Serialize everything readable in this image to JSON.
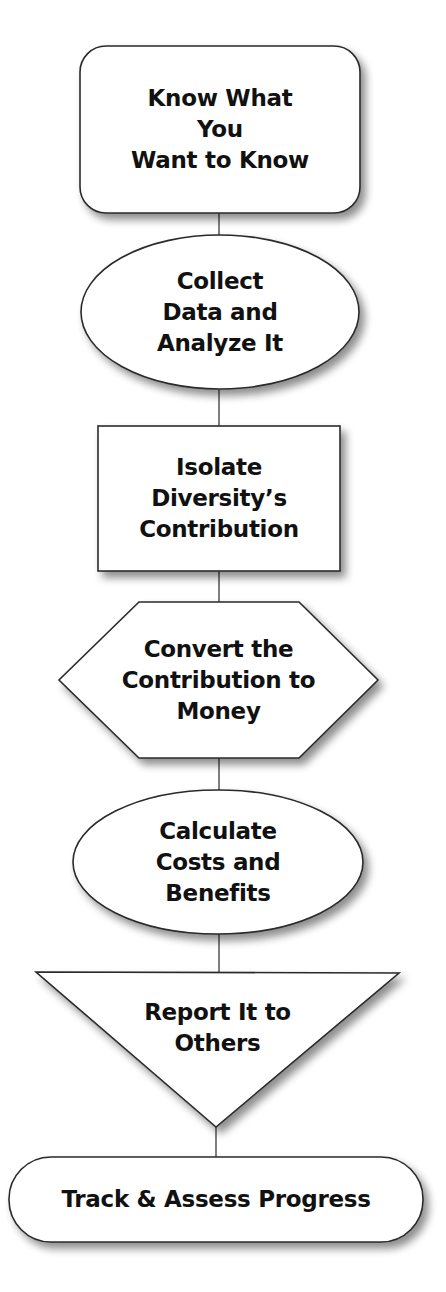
{
  "diagram": {
    "type": "vertical-flowchart",
    "colors": {
      "fill": "#ffffff",
      "stroke": "#2a2a2a",
      "text": "#111111",
      "shadow": "#9a9a9a"
    },
    "steps": [
      {
        "id": "step1",
        "shape": "rounded-rectangle",
        "lines": [
          "Know What",
          "You",
          "Want to Know"
        ]
      },
      {
        "id": "step2",
        "shape": "ellipse",
        "lines": [
          "Collect",
          "Data and",
          "Analyze It"
        ]
      },
      {
        "id": "step3",
        "shape": "rectangle",
        "lines": [
          "Isolate",
          "Diversity’s",
          "Contribution"
        ]
      },
      {
        "id": "step4",
        "shape": "hexagon",
        "lines": [
          "Convert the",
          "Contribution to",
          "Money"
        ]
      },
      {
        "id": "step5",
        "shape": "ellipse",
        "lines": [
          "Calculate",
          "Costs and",
          "Benefits"
        ]
      },
      {
        "id": "step6",
        "shape": "inverted-triangle",
        "lines": [
          "Report It to",
          "Others"
        ]
      },
      {
        "id": "step7",
        "shape": "pill",
        "lines": [
          "Track & Assess Progress"
        ]
      }
    ]
  }
}
